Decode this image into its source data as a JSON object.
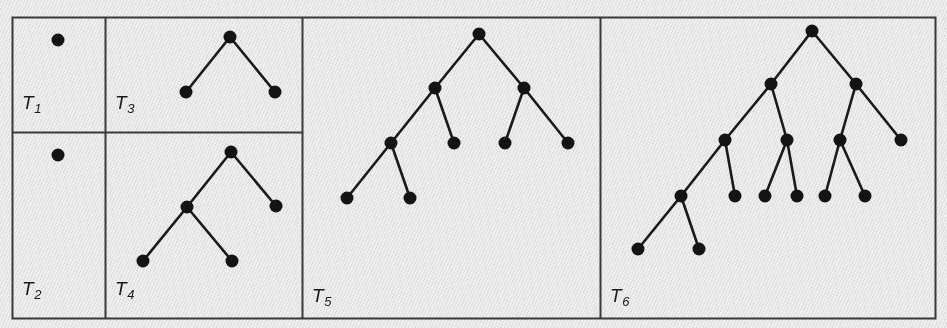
{
  "figure": {
    "caption_absent": true,
    "width": 947,
    "height": 328,
    "background_color": "#f2f2f2",
    "ink_color": "#1a1a1a",
    "border_color": "#3b3b3b",
    "node_color": "#141414",
    "edge_color": "#1a1a1a"
  },
  "frame": {
    "x": 12,
    "y": 17,
    "width": 923,
    "height": 301,
    "stroke_width": 2
  },
  "dividers": {
    "vertical_x": [
      105,
      302,
      600
    ],
    "horizontal": {
      "y": 132,
      "x_start": 12,
      "x_end": 302
    }
  },
  "panels": [
    {
      "id": "T1",
      "label_text": "T",
      "label_subscript": "1",
      "label_x": 22,
      "label_y": 92,
      "rect": {
        "x": 12,
        "y": 17,
        "width": 93,
        "height": 115
      },
      "node_count": 1,
      "edge_count": 0,
      "description": "single root node, no edges"
    },
    {
      "id": "T2",
      "label_text": "T",
      "label_subscript": "2",
      "label_x": 22,
      "label_y": 278,
      "rect": {
        "x": 12,
        "y": 132,
        "width": 93,
        "height": 186
      },
      "node_count": 1,
      "edge_count": 0,
      "description": "single root node, no edges"
    },
    {
      "id": "T3",
      "label_text": "T",
      "label_subscript": "3",
      "label_x": 115,
      "label_y": 92,
      "rect": {
        "x": 105,
        "y": 17,
        "width": 197,
        "height": 115
      },
      "node_count": 3,
      "edge_count": 2,
      "description": "root with two leaf children"
    },
    {
      "id": "T4",
      "label_text": "T",
      "label_subscript": "4",
      "label_x": 115,
      "label_y": 278,
      "rect": {
        "x": 105,
        "y": 132,
        "width": 197,
        "height": 186
      },
      "node_count": 5,
      "edge_count": 4,
      "description": "root, left child expanded into two leaves, right child a leaf"
    },
    {
      "id": "T5",
      "label_text": "T",
      "label_subscript": "5",
      "label_x": 312,
      "label_y": 285,
      "rect": {
        "x": 302,
        "y": 17,
        "width": 298,
        "height": 301
      },
      "node_count": 9,
      "edge_count": 8,
      "description": "complete binary tree of depth two with the leftmost leaf expanded into two leaves"
    },
    {
      "id": "T6",
      "label_text": "T",
      "label_subscript": "6",
      "label_x": 610,
      "label_y": 285,
      "rect": {
        "x": 600,
        "y": 17,
        "width": 335,
        "height": 301
      },
      "node_count": 15,
      "edge_count": 14,
      "description": "larger tree, four levels deep on the left spine"
    }
  ],
  "node_radius": 6.5,
  "edge_width": 2.6,
  "trees": {
    "T1": {
      "nodes": [
        {
          "id": "a",
          "x": 58,
          "y": 40
        }
      ],
      "edges": []
    },
    "T2": {
      "nodes": [
        {
          "id": "a",
          "x": 58,
          "y": 155
        }
      ],
      "edges": []
    },
    "T3": {
      "nodes": [
        {
          "id": "r",
          "x": 230,
          "y": 37
        },
        {
          "id": "l",
          "x": 186,
          "y": 92
        },
        {
          "id": "rr",
          "x": 275,
          "y": 92
        }
      ],
      "edges": [
        [
          "r",
          "l"
        ],
        [
          "r",
          "rr"
        ]
      ]
    },
    "T4": {
      "nodes": [
        {
          "id": "r",
          "x": 231,
          "y": 152
        },
        {
          "id": "l",
          "x": 187,
          "y": 207
        },
        {
          "id": "rr",
          "x": 276,
          "y": 206
        },
        {
          "id": "ll",
          "x": 143,
          "y": 261
        },
        {
          "id": "lr",
          "x": 232,
          "y": 261
        }
      ],
      "edges": [
        [
          "r",
          "l"
        ],
        [
          "r",
          "rr"
        ],
        [
          "l",
          "ll"
        ],
        [
          "l",
          "lr"
        ]
      ]
    },
    "T5": {
      "nodes": [
        {
          "id": "r",
          "x": 479,
          "y": 34
        },
        {
          "id": "l",
          "x": 435,
          "y": 88
        },
        {
          "id": "rr",
          "x": 524,
          "y": 88
        },
        {
          "id": "ll",
          "x": 391,
          "y": 143
        },
        {
          "id": "lr",
          "x": 454,
          "y": 143
        },
        {
          "id": "rl",
          "x": 505,
          "y": 143
        },
        {
          "id": "rrr",
          "x": 568,
          "y": 143
        },
        {
          "id": "lll",
          "x": 347,
          "y": 198
        },
        {
          "id": "llr",
          "x": 410,
          "y": 198
        }
      ],
      "edges": [
        [
          "r",
          "l"
        ],
        [
          "r",
          "rr"
        ],
        [
          "l",
          "ll"
        ],
        [
          "l",
          "lr"
        ],
        [
          "rr",
          "rl"
        ],
        [
          "rr",
          "rrr"
        ],
        [
          "ll",
          "lll"
        ],
        [
          "ll",
          "llr"
        ]
      ]
    },
    "T6": {
      "nodes": [
        {
          "id": "r",
          "x": 812,
          "y": 31
        },
        {
          "id": "l",
          "x": 771,
          "y": 84
        },
        {
          "id": "rr",
          "x": 856,
          "y": 84
        },
        {
          "id": "ll",
          "x": 725,
          "y": 140
        },
        {
          "id": "lr",
          "x": 787,
          "y": 140
        },
        {
          "id": "rl",
          "x": 840,
          "y": 140
        },
        {
          "id": "rrr",
          "x": 901,
          "y": 140
        },
        {
          "id": "lll",
          "x": 681,
          "y": 196
        },
        {
          "id": "llr",
          "x": 735,
          "y": 196
        },
        {
          "id": "lrl",
          "x": 765,
          "y": 196
        },
        {
          "id": "lrr",
          "x": 797,
          "y": 196
        },
        {
          "id": "rll",
          "x": 825,
          "y": 196
        },
        {
          "id": "rlr",
          "x": 865,
          "y": 196
        },
        {
          "id": "llll",
          "x": 638,
          "y": 249
        },
        {
          "id": "lllr",
          "x": 699,
          "y": 249
        }
      ],
      "edges": [
        [
          "r",
          "l"
        ],
        [
          "r",
          "rr"
        ],
        [
          "l",
          "ll"
        ],
        [
          "l",
          "lr"
        ],
        [
          "rr",
          "rl"
        ],
        [
          "rr",
          "rrr"
        ],
        [
          "ll",
          "lll"
        ],
        [
          "ll",
          "llr"
        ],
        [
          "lr",
          "lrl"
        ],
        [
          "lr",
          "lrr"
        ],
        [
          "rl",
          "rll"
        ],
        [
          "rl",
          "rlr"
        ],
        [
          "lll",
          "llll"
        ],
        [
          "lll",
          "lllr"
        ]
      ]
    }
  }
}
